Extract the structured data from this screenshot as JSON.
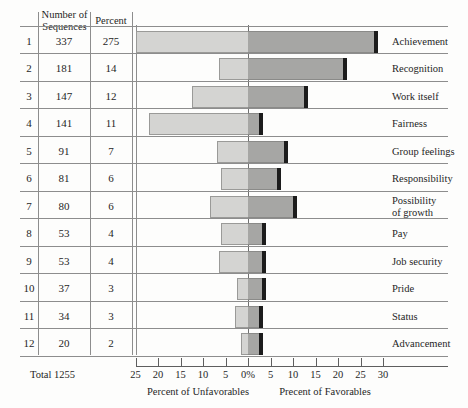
{
  "table": {
    "headers": {
      "index": "",
      "sequences_line1": "Number of",
      "sequences_line2": "Sequences",
      "percent": "Percent"
    },
    "total_label": "Total 1255"
  },
  "axis": {
    "left_title": "Percent of Unfavorables",
    "right_title": "Precent of Favorables",
    "ticks": [
      "25",
      "20",
      "15",
      "10",
      "5",
      "0%",
      "5",
      "10",
      "15",
      "20",
      "25",
      "30"
    ],
    "zero_index": 5,
    "step_percent": 5,
    "pixels_per_percent": 4.5,
    "zero_x": 248
  },
  "colors": {
    "unfavorable_bar": "#d4d4d2",
    "favorable_bar": "#a6a6a4",
    "bar_edge": "#1c1c1c",
    "rule": "#8d8d8d",
    "background": "#fdfdfc"
  },
  "chart_data": {
    "type": "bar",
    "title": "",
    "subtype": "diverging-horizontal",
    "xlabel": "Percent",
    "ylabel": "",
    "xlim": [
      -25,
      30
    ],
    "grid": false,
    "legend": [],
    "categories": [
      "Achievement",
      "Recognition",
      "Work itself",
      "Fairness",
      "Group feelings",
      "Responsibility",
      "Possibility of growth",
      "Pay",
      "Job security",
      "Pride",
      "Status",
      "Advancement"
    ],
    "series": [
      {
        "name": "Percent of Unfavorables",
        "values": [
          25,
          6.5,
          12.5,
          22,
          7,
          6,
          8.5,
          6,
          6.5,
          2.5,
          3,
          1.5
        ]
      },
      {
        "name": "Precent of Favorables",
        "values": [
          28,
          21,
          12.5,
          2.5,
          8,
          6.5,
          10,
          3,
          3,
          3,
          2.5,
          2.5
        ]
      }
    ]
  },
  "rows": [
    {
      "index": "1",
      "sequences": "337",
      "percent": "275",
      "label": "Achievement",
      "label_lines": [
        "Achievement"
      ],
      "unfav": 25,
      "fav": 28
    },
    {
      "index": "2",
      "sequences": "181",
      "percent": "14",
      "label": "Recognition",
      "label_lines": [
        "Recognition"
      ],
      "unfav": 6.5,
      "fav": 21
    },
    {
      "index": "3",
      "sequences": "147",
      "percent": "12",
      "label": "Work itself",
      "label_lines": [
        "Work itself"
      ],
      "unfav": 12.5,
      "fav": 12.5
    },
    {
      "index": "4",
      "sequences": "141",
      "percent": "11",
      "label": "Fairness",
      "label_lines": [
        "Fairness"
      ],
      "unfav": 22,
      "fav": 2.5
    },
    {
      "index": "5",
      "sequences": "91",
      "percent": "7",
      "label": "Group feelings",
      "label_lines": [
        "Group feelings"
      ],
      "unfav": 7,
      "fav": 8
    },
    {
      "index": "6",
      "sequences": "81",
      "percent": "6",
      "label": "Responsibility",
      "label_lines": [
        "Responsibility"
      ],
      "unfav": 6,
      "fav": 6.5
    },
    {
      "index": "7",
      "sequences": "80",
      "percent": "6",
      "label": "Possibility of growth",
      "label_lines": [
        "Possibility",
        "of growth"
      ],
      "unfav": 8.5,
      "fav": 10
    },
    {
      "index": "8",
      "sequences": "53",
      "percent": "4",
      "label": "Pay",
      "label_lines": [
        "Pay"
      ],
      "unfav": 6,
      "fav": 3
    },
    {
      "index": "9",
      "sequences": "53",
      "percent": "4",
      "label": "Job security",
      "label_lines": [
        "Job security"
      ],
      "unfav": 6.5,
      "fav": 3
    },
    {
      "index": "10",
      "sequences": "37",
      "percent": "3",
      "label": "Pride",
      "label_lines": [
        "Pride"
      ],
      "unfav": 2.5,
      "fav": 3
    },
    {
      "index": "11",
      "sequences": "34",
      "percent": "3",
      "label": "Status",
      "label_lines": [
        "Status"
      ],
      "unfav": 3,
      "fav": 2.5
    },
    {
      "index": "12",
      "sequences": "20",
      "percent": "2",
      "label": "Advancement",
      "label_lines": [
        "Advancement"
      ],
      "unfav": 1.5,
      "fav": 2.5
    }
  ]
}
